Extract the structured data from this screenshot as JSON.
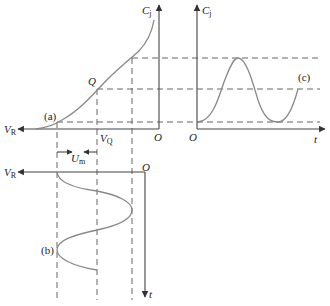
{
  "diagram": {
    "colors": {
      "axis": "#444444",
      "curve": "#888888",
      "dash": "#555555",
      "text": "#222222"
    },
    "labels": {
      "cj_left": "C",
      "cj_left_sub": "j",
      "cj_right": "C",
      "cj_right_sub": "j",
      "vr_top": "V",
      "vr_top_sub": "R",
      "vr_bottom": "V",
      "vr_bottom_sub": "R",
      "vq": "V",
      "vq_sub": "Q",
      "um": "U",
      "um_sub": "m",
      "q_point": "Q",
      "origin_left": "O",
      "origin_right": "O",
      "origin_bottom": "O",
      "t_right": "t",
      "t_bottom": "t",
      "curve_a": "(a)",
      "curve_b": "(b)",
      "curve_c": "(c)"
    }
  }
}
